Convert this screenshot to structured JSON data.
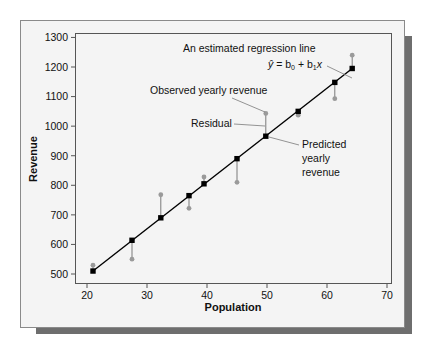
{
  "chart_data": {
    "type": "scatter",
    "title": "",
    "xlabel": "Population",
    "ylabel": "Revenue",
    "xlim": [
      18,
      71
    ],
    "ylim": [
      465,
      1310
    ],
    "xticks": [
      20,
      30,
      40,
      50,
      60,
      70
    ],
    "yticks": [
      500,
      600,
      700,
      800,
      900,
      1000,
      1100,
      1200,
      1300
    ],
    "grid": false,
    "legend": null,
    "regression_line": {
      "x0": 21,
      "y0": 510,
      "x1": 64.2,
      "y1": 1195
    },
    "series": [
      {
        "name": "Observed yearly revenue",
        "marker": "circle",
        "color": "#9a9a9a",
        "x": [
          21,
          27.5,
          32.3,
          37,
          39.5,
          45,
          49.8,
          55.2,
          61.3,
          64.2
        ],
        "y": [
          530,
          550,
          768,
          722,
          828,
          810,
          1043,
          1037,
          1093,
          1240
        ]
      },
      {
        "name": "Predicted yearly revenue",
        "marker": "square",
        "color": "#000000",
        "x": [
          21,
          27.5,
          32.3,
          37,
          39.5,
          45,
          49.8,
          55.2,
          61.3,
          64.2
        ],
        "y": [
          510,
          614,
          690,
          765,
          805,
          890,
          966,
          1050,
          1148,
          1195
        ]
      }
    ],
    "annotations": [
      {
        "text": "An estimated regression line",
        "target": "regression line"
      },
      {
        "text": "ŷ = b0 + b1x",
        "target": "regression line"
      },
      {
        "text": "Observed yearly revenue",
        "target": "observed point at x≈49.8"
      },
      {
        "text": "Residual",
        "target": "vertical segment at x≈49.8"
      },
      {
        "text": "Predicted yearly revenue",
        "target": "predicted point at x≈49.8"
      }
    ]
  },
  "labels": {
    "xlabel": "Population",
    "ylabel": "Revenue",
    "ann_line": "An estimated regression line",
    "ann_observed": "Observed yearly revenue",
    "ann_residual": "Residual",
    "ann_pred_1": "Predicted",
    "ann_pred_2": "yearly",
    "ann_pred_3": "revenue",
    "eq_yhat": "ŷ",
    "eq_eq": " = b",
    "eq_sub0": "0",
    "eq_plus": " + b",
    "eq_sub1": "1",
    "eq_x": "x"
  },
  "colors": {
    "frame_bg": "#f4f4f4",
    "frame_border": "#8a8a8a",
    "shadow": "#6e6e6e",
    "axis": "#555555",
    "line": "#000000",
    "observed": "#9a9a9a",
    "residual": "#7a7a7a",
    "leader": "#7a7a7a"
  }
}
